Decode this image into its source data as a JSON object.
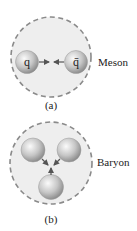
{
  "meson": {
    "label": "Meson",
    "caption": "(a)",
    "quark_label": "q",
    "antiquark_label": "q̄"
  },
  "baryon": {
    "label": "Baryon",
    "caption": "(b)"
  },
  "colors": {
    "region_fill": "#eeeeee",
    "dash_stroke": "#8a8a8a",
    "ball_light": "#f4f4f4",
    "ball_dark": "#8e8e8e",
    "arrow": "#555555",
    "text": "#222222"
  }
}
